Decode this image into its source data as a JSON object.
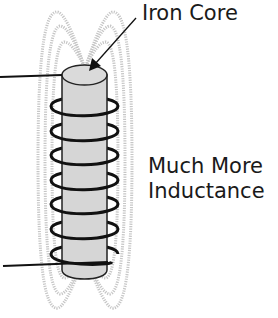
{
  "diagram": {
    "labels": {
      "core": "Iron Core",
      "inductance_line1": "Much More",
      "inductance_line2": "Inductance"
    },
    "components": {
      "core": {
        "name": "iron-core",
        "fill": "#d4d4d4",
        "stroke": "#222222"
      },
      "coil": {
        "name": "coil-winding",
        "turns": 7,
        "stroke": "#111111"
      },
      "field_lines": {
        "name": "magnetic-field-lines",
        "count_per_side": 3,
        "stroke": "#c8c8c8"
      },
      "leads": [
        "top-lead-wire",
        "bottom-lead-wire"
      ]
    }
  }
}
